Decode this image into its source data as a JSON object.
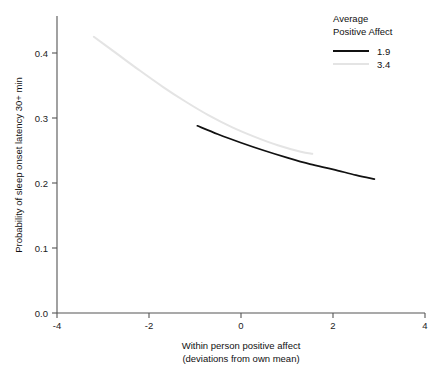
{
  "chart_data": {
    "type": "line",
    "title": "",
    "xlabel": "Within person positive affect (deviations from own mean)",
    "xlabel_line1": "Within person positive affect",
    "xlabel_line2": "(deviations from own mean)",
    "ylabel": "Probability of sleep onset latency 30+ min",
    "xlim": [
      -4,
      4
    ],
    "ylim": [
      0.0,
      0.45
    ],
    "xticks": [
      -4,
      -2,
      0,
      2,
      4
    ],
    "xtick_labels": [
      "-4",
      "-2",
      "0",
      "2",
      "4"
    ],
    "yticks": [
      0.0,
      0.1,
      0.2,
      0.3,
      0.4
    ],
    "ytick_labels": [
      "0.0",
      "0.1",
      "0.2",
      "0.3",
      "0.4"
    ],
    "grid": false,
    "legend_position": "top-right",
    "legend_title_line1": "Average",
    "legend_title_line2": "Positive Affect",
    "series": [
      {
        "name": "1.9",
        "color": "#111111",
        "x": [
          -0.95,
          -0.5,
          0.0,
          0.5,
          1.0,
          1.5,
          2.0,
          2.5,
          2.9
        ],
        "y": [
          0.288,
          0.275,
          0.262,
          0.25,
          0.239,
          0.229,
          0.221,
          0.212,
          0.206
        ]
      },
      {
        "name": "3.4",
        "color": "#e4e4e4",
        "x": [
          -3.2,
          -2.7,
          -2.2,
          -1.7,
          -1.2,
          -0.7,
          -0.2,
          0.3,
          0.8,
          1.3,
          1.55
        ],
        "y": [
          0.425,
          0.399,
          0.373,
          0.348,
          0.325,
          0.304,
          0.286,
          0.271,
          0.258,
          0.248,
          0.245
        ]
      }
    ]
  },
  "colors": {
    "axis": "#555555",
    "series_1_9": "#111111",
    "series_3_4": "#e4e4e4",
    "background": "#ffffff"
  }
}
